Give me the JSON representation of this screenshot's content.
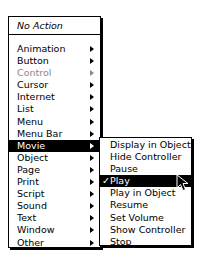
{
  "main_menu": {
    "header": "No Action",
    "items": [
      {
        "label": "Animation",
        "submenu": true,
        "disabled": false
      },
      {
        "label": "Button",
        "submenu": true,
        "disabled": false
      },
      {
        "label": "Control",
        "submenu": true,
        "disabled": true
      },
      {
        "label": "Cursor",
        "submenu": true,
        "disabled": false
      },
      {
        "label": "Internet",
        "submenu": true,
        "disabled": false
      },
      {
        "label": "List",
        "submenu": true,
        "disabled": false
      },
      {
        "label": "Menu",
        "submenu": true,
        "disabled": false
      },
      {
        "label": "Menu Bar",
        "submenu": true,
        "disabled": false
      },
      {
        "label": "Movie",
        "submenu": true,
        "disabled": false,
        "highlighted": true
      },
      {
        "label": "Object",
        "submenu": true,
        "disabled": false
      },
      {
        "label": "Page",
        "submenu": true,
        "disabled": false
      },
      {
        "label": "Print",
        "submenu": true,
        "disabled": false
      },
      {
        "label": "Script",
        "submenu": true,
        "disabled": false
      },
      {
        "label": "Sound",
        "submenu": true,
        "disabled": false
      },
      {
        "label": "Text",
        "submenu": true,
        "disabled": false
      },
      {
        "label": "Window",
        "submenu": true,
        "disabled": false
      },
      {
        "label": "Other",
        "submenu": true,
        "disabled": false
      }
    ]
  },
  "movie_submenu": {
    "items": [
      {
        "label": "Display in Object"
      },
      {
        "label": "Hide Controller"
      },
      {
        "label": "Pause"
      },
      {
        "label": "Play",
        "checked": true,
        "highlighted": true
      },
      {
        "label": "Play in Object"
      },
      {
        "label": "Resume"
      },
      {
        "label": "Set Volume"
      },
      {
        "label": "Show Controller"
      },
      {
        "label": "Stop"
      }
    ],
    "check_glyph": "✓"
  },
  "colors": {
    "highlight_bg": "#000000",
    "highlight_fg": "#ffffff",
    "disabled": "#8a8a8a"
  }
}
